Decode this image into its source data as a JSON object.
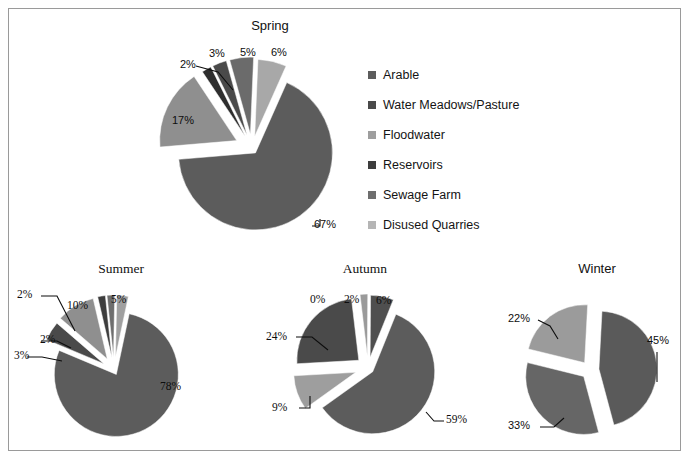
{
  "figure": {
    "background": "#ffffff",
    "border_color": "#9a9a9a"
  },
  "legend": {
    "name": "series-legend",
    "items": [
      {
        "label": "Arable",
        "color": "#5c5c5c"
      },
      {
        "label": "Water Meadows/Pasture",
        "color": "#4a4a4a"
      },
      {
        "label": "Floodwater",
        "color": "#9e9e9e"
      },
      {
        "label": "Reservoirs",
        "color": "#3d3d3d"
      },
      {
        "label": "Sewage Farm",
        "color": "#6e6e6e"
      },
      {
        "label": "Disused Quarries",
        "color": "#b5b5b5"
      }
    ]
  },
  "chart_data": [
    {
      "type": "pie",
      "title": "Spring",
      "categories": [
        "Arable",
        "Water Meadows/Pasture",
        "Floodwater",
        "Reservoirs",
        "Sewage Farm",
        "Disused Quarries"
      ],
      "values": [
        67,
        17,
        2,
        3,
        5,
        6
      ],
      "labels": [
        "67%",
        "17%",
        "2%",
        "3%",
        "5%",
        "6%"
      ],
      "colors": [
        "#5c5c5c",
        "#8f8f8f",
        "#2e2e2e",
        "#4a4a4a",
        "#6b6b6b",
        "#a8a8a8"
      ],
      "exploded": true,
      "legend_position": "right"
    },
    {
      "type": "pie",
      "title": "Summer",
      "categories": [
        "Arable",
        "Water Meadows/Pasture",
        "Floodwater",
        "Reservoirs",
        "Sewage Farm",
        "Disused Quarries"
      ],
      "values": [
        78,
        5,
        10,
        2,
        2,
        3
      ],
      "labels": [
        "78%",
        "5%",
        "10%",
        "2%",
        "2%",
        "3%"
      ],
      "colors": [
        "#5c5c5c",
        "#4a4a4a",
        "#8f8f8f",
        "#3d3d3d",
        "#6e6e6e",
        "#a0a0a0"
      ],
      "exploded": true,
      "legend_position": "none"
    },
    {
      "type": "pie",
      "title": "Autumn",
      "categories": [
        "Arable",
        "Water Meadows/Pasture",
        "Floodwater",
        "Reservoirs",
        "Sewage Farm",
        "Disused Quarries"
      ],
      "values": [
        59,
        9,
        24,
        0,
        2,
        6
      ],
      "labels": [
        "59%",
        "9%",
        "24%",
        "0%",
        "2%",
        "6%"
      ],
      "colors": [
        "#5c5c5c",
        "#9e9e9e",
        "#4a4a4a",
        "#3d3d3d",
        "#9a9a9a",
        "#4f4f4f"
      ],
      "exploded": true,
      "legend_position": "none"
    },
    {
      "type": "pie",
      "title": "Winter",
      "categories": [
        "Arable",
        "Water Meadows/Pasture",
        "Disused Quarries"
      ],
      "values": [
        45,
        33,
        22
      ],
      "labels": [
        "45%",
        "33%",
        "22%"
      ],
      "colors": [
        "#5a5a5a",
        "#666666",
        "#9b9b9b"
      ],
      "exploded": true,
      "legend_position": "none"
    }
  ]
}
